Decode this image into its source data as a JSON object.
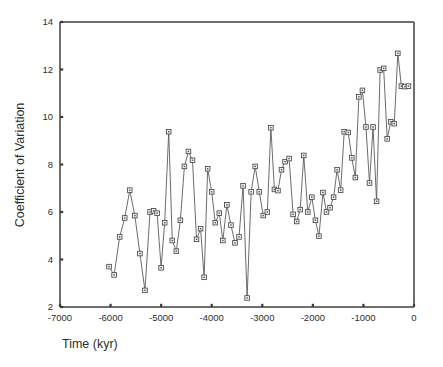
{
  "chart_data": {
    "type": "line",
    "title": "",
    "xlabel": "Time (kyr)",
    "ylabel": "Coefficient of Variation",
    "xlim": [
      -7000,
      0
    ],
    "ylim": [
      2,
      14
    ],
    "xticks": [
      -7000,
      -6000,
      -5000,
      -4000,
      -3000,
      -2000,
      -1000,
      0
    ],
    "xticklabels": [
      "-7000",
      "-6000",
      "-5000",
      "-4000",
      "-3000",
      "-2000",
      "-1000",
      "0"
    ],
    "yticks": [
      2,
      4,
      6,
      8,
      10,
      12,
      14
    ],
    "yticklabels": [
      "2",
      "4",
      "6",
      "8",
      "10",
      "12",
      "14"
    ],
    "grid": false,
    "legend": null,
    "marker": "open-square",
    "line_color": "#5b5b5b",
    "marker_face_color": "#f2f2f2",
    "marker_edge_color": "#3d3d3d",
    "series": [
      {
        "name": "Coefficient of Variation",
        "x": [
          -6030,
          -5930,
          -5820,
          -5720,
          -5620,
          -5520,
          -5420,
          -5320,
          -5220,
          -5150,
          -5080,
          -5000,
          -4930,
          -4850,
          -4780,
          -4700,
          -4620,
          -4540,
          -4460,
          -4380,
          -4300,
          -4220,
          -4150,
          -4080,
          -4000,
          -3930,
          -3850,
          -3780,
          -3700,
          -3620,
          -3540,
          -3460,
          -3380,
          -3300,
          -3220,
          -3140,
          -3060,
          -2980,
          -2900,
          -2830,
          -2760,
          -2690,
          -2620,
          -2550,
          -2470,
          -2390,
          -2320,
          -2250,
          -2180,
          -2100,
          -2020,
          -1950,
          -1880,
          -1800,
          -1730,
          -1660,
          -1590,
          -1520,
          -1450,
          -1380,
          -1300,
          -1230,
          -1160,
          -1090,
          -1020,
          -950,
          -880,
          -810,
          -740,
          -670,
          -600,
          -530,
          -460,
          -390,
          -320,
          -250,
          -180,
          -110
        ],
        "y": [
          3.7,
          3.35,
          4.95,
          5.75,
          6.92,
          5.85,
          4.25,
          2.7,
          6.0,
          6.05,
          5.95,
          3.65,
          5.55,
          9.38,
          4.8,
          4.35,
          5.65,
          7.92,
          8.55,
          8.18,
          4.85,
          5.3,
          3.25,
          7.82,
          6.85,
          5.55,
          5.95,
          4.8,
          6.3,
          5.45,
          4.7,
          4.95,
          7.1,
          2.38,
          6.85,
          7.92,
          6.85,
          5.85,
          6.0,
          9.55,
          6.95,
          6.9,
          7.78,
          8.12,
          8.25,
          5.9,
          5.6,
          6.1,
          8.38,
          6.0,
          6.62,
          5.65,
          4.98,
          6.82,
          6.0,
          6.18,
          6.62,
          7.78,
          6.92,
          9.38,
          9.35,
          8.28,
          7.45,
          10.85,
          11.12,
          9.58,
          7.22,
          9.58,
          6.45,
          11.98,
          12.05,
          9.08,
          9.8,
          9.72,
          12.68,
          11.3,
          11.28,
          11.3
        ]
      }
    ]
  },
  "figure": {
    "background": "#ffffff"
  }
}
